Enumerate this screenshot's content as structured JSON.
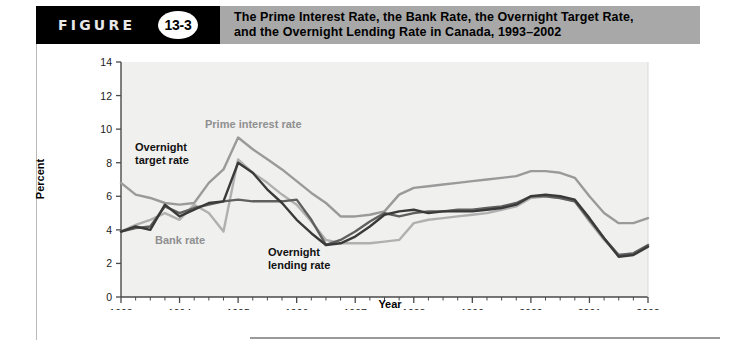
{
  "header": {
    "figure_word": "FIGURE",
    "figure_number": "13-3",
    "title_line1": "The Prime Interest Rate, the Bank Rate, the Overnight Target Rate,",
    "title_line2": "and the Overnight Lending Rate in Canada, 1993–2002"
  },
  "colors": {
    "prime": "#9a9a9a",
    "bank": "#b0b0b0",
    "overnight_target": "#3a3a3a",
    "overnight_lending": "#606060",
    "plot_background": "#f0f0ef",
    "axis": "#4a4a4a",
    "header_band": "#a8a8a8",
    "header_black": "#000000"
  },
  "annotations": {
    "prime_label": "Prime interest rate",
    "bank_label": "Bank rate",
    "overnight_target_label_line1": "Overnight",
    "overnight_target_label_line2": "target rate",
    "overnight_lending_label_line1": "Overnight",
    "overnight_lending_label_line2": "lending rate"
  },
  "chart_data": {
    "type": "line",
    "title": "The Prime Interest Rate, the Bank Rate, the Overnight Target Rate, and the Overnight Lending Rate in Canada, 1993–2002",
    "xlabel": "Year",
    "ylabel": "Percent",
    "xlim": [
      1993,
      2002
    ],
    "ylim": [
      0,
      14
    ],
    "ytick_step": 2,
    "yticks": [
      0,
      2,
      4,
      6,
      8,
      10,
      12,
      14
    ],
    "xticks": [
      1993,
      1994,
      1995,
      1996,
      1997,
      1998,
      1999,
      2000,
      2001,
      2002
    ],
    "minor_ticks_per_year": 4,
    "grid": false,
    "legend": "inline-annotations",
    "x": [
      1993.0,
      1993.25,
      1993.5,
      1993.75,
      1994.0,
      1994.25,
      1994.5,
      1994.75,
      1995.0,
      1995.25,
      1995.5,
      1995.75,
      1996.0,
      1996.25,
      1996.5,
      1996.75,
      1997.0,
      1997.25,
      1997.5,
      1997.75,
      1998.0,
      1998.25,
      1998.5,
      1998.75,
      1999.0,
      1999.25,
      1999.5,
      1999.75,
      2000.0,
      2000.25,
      2000.5,
      2000.75,
      2001.0,
      2001.25,
      2001.5,
      2001.75,
      2002.0
    ],
    "series": [
      {
        "name": "Prime interest rate",
        "color": "#9a9a9a",
        "values": [
          6.8,
          6.1,
          5.9,
          5.6,
          5.5,
          5.6,
          6.8,
          7.6,
          9.5,
          8.8,
          8.2,
          7.6,
          6.9,
          6.2,
          5.6,
          4.8,
          4.8,
          4.9,
          5.1,
          6.1,
          6.5,
          6.6,
          6.7,
          6.8,
          6.9,
          7.0,
          7.1,
          7.2,
          7.5,
          7.5,
          7.4,
          7.1,
          6.0,
          5.0,
          4.4,
          4.4,
          4.7
        ]
      },
      {
        "name": "Bank rate",
        "color": "#b0b0b0",
        "values": [
          3.9,
          4.3,
          4.6,
          5.0,
          4.6,
          5.5,
          5.0,
          3.9,
          8.2,
          7.4,
          6.8,
          6.1,
          5.5,
          4.5,
          3.4,
          3.2,
          3.2,
          3.2,
          3.3,
          3.4,
          4.4,
          4.6,
          4.7,
          4.8,
          4.9,
          5.0,
          5.2,
          5.4,
          5.9,
          6.0,
          5.9,
          5.7,
          4.5,
          3.4,
          2.5,
          2.6,
          3.0
        ]
      },
      {
        "name": "Overnight target rate",
        "color": "#3a3a3a",
        "values": [
          3.9,
          4.2,
          4.0,
          5.5,
          4.8,
          5.2,
          5.6,
          5.7,
          8.0,
          7.4,
          6.4,
          5.6,
          4.6,
          3.8,
          3.1,
          3.2,
          3.6,
          4.2,
          4.9,
          5.1,
          5.2,
          5.0,
          5.1,
          5.1,
          5.1,
          5.2,
          5.3,
          5.5,
          6.0,
          6.1,
          6.0,
          5.8,
          4.7,
          3.5,
          2.4,
          2.5,
          3.0
        ]
      },
      {
        "name": "Overnight lending rate",
        "color": "#606060",
        "values": [
          3.9,
          4.1,
          4.2,
          5.4,
          5.0,
          5.3,
          5.5,
          5.7,
          5.8,
          5.7,
          5.7,
          5.7,
          5.8,
          4.6,
          3.1,
          3.4,
          3.9,
          4.5,
          5.0,
          4.8,
          5.0,
          5.1,
          5.1,
          5.2,
          5.2,
          5.3,
          5.4,
          5.6,
          6.0,
          6.0,
          5.9,
          5.7,
          4.6,
          3.5,
          2.5,
          2.6,
          3.1
        ]
      }
    ]
  }
}
